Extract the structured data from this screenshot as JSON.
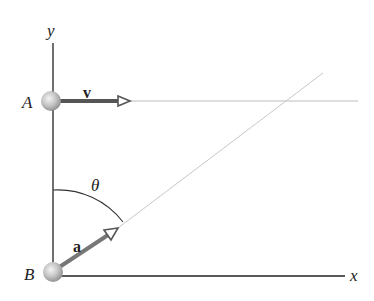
{
  "diagram": {
    "type": "kinematics",
    "axes": {
      "x_label": "x",
      "y_label": "y"
    },
    "points": [
      {
        "id": "A",
        "label": "A",
        "cx": 51,
        "cy": 101
      },
      {
        "id": "B",
        "label": "B",
        "cx": 53,
        "cy": 272
      }
    ],
    "vectors": [
      {
        "id": "v",
        "label": "v",
        "from": "A",
        "direction": "horizontal"
      },
      {
        "id": "a",
        "label": "a",
        "from": "B",
        "direction": "angled"
      }
    ],
    "angle": {
      "label": "θ",
      "between": [
        "y-axis",
        "a"
      ]
    },
    "colors": {
      "axis": "#222222",
      "vector": "#555555",
      "guide": "#bbbbbb",
      "sphere": "#b0b0b0"
    }
  }
}
